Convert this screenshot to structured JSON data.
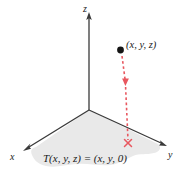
{
  "figure": {
    "axes": {
      "z_label": "z",
      "x_label": "x",
      "y_label": "y"
    },
    "annotations": {
      "point_label": "(x, y, z)",
      "map_label": "T(x, y, z) = (x, y, 0)"
    },
    "markers": {
      "point_dot": "point-dot",
      "projection_cross": "x-cross-marker",
      "drop_arrow": "down-arrow-icon"
    },
    "colors": {
      "axis": "#3a3a3a",
      "plane_fill": "#e9e9e9",
      "accent_red": "#e8575f",
      "text": "#1a1a1a",
      "background": "#ffffff"
    },
    "geometry": {
      "origin": [
        89,
        110
      ],
      "z_axis_top": [
        89,
        14
      ],
      "x_axis_end": [
        24,
        150
      ],
      "y_axis_end": [
        166,
        146
      ],
      "point": [
        120,
        50
      ],
      "projection": [
        128,
        143
      ]
    }
  }
}
